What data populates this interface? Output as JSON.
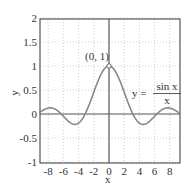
{
  "chart_data": {
    "type": "line",
    "title": "",
    "xlabel": "x",
    "ylabel": "y",
    "xlim": [
      -9.42,
      9.42
    ],
    "ylim": [
      -1,
      2
    ],
    "xticks": [
      -8,
      -6,
      -4,
      -2,
      0,
      2,
      4,
      6,
      8
    ],
    "xtick_labels": [
      "-8",
      "-6",
      "-4",
      "-2",
      "0",
      "2",
      "4",
      "6",
      "8"
    ],
    "yticks": [
      -1,
      -0.5,
      0,
      0.5,
      1,
      1.5,
      2
    ],
    "ytick_labels": [
      "-1",
      "-0.5",
      "0",
      "0.5",
      "1",
      "1.5",
      "2"
    ],
    "grid": true,
    "legend": null,
    "series": [
      {
        "name": "y = sin x / x",
        "function": "sin(x)/x",
        "x": [
          -9.42,
          -8,
          -7.73,
          -6.28,
          -4.49,
          -3.14,
          -2,
          -1,
          0,
          1,
          2,
          3.14,
          4.49,
          6.28,
          7.73,
          8,
          9.42
        ],
        "values": [
          0.0,
          0.124,
          0.128,
          0.0,
          -0.217,
          0.0,
          0.455,
          0.841,
          1.0,
          0.841,
          0.455,
          0.0,
          -0.217,
          0.0,
          0.128,
          0.124,
          0.0
        ]
      }
    ],
    "annotations": [
      {
        "text": "(0, 1)",
        "x": 0,
        "y": 1,
        "marker": "open-circle"
      },
      {
        "text_lhs": "y =",
        "numerator": "sin x",
        "denominator": "x"
      }
    ],
    "colors": {
      "curve": "#888888",
      "axes": "#555555",
      "grid": "#bbbbbb",
      "text": "#333333"
    }
  }
}
